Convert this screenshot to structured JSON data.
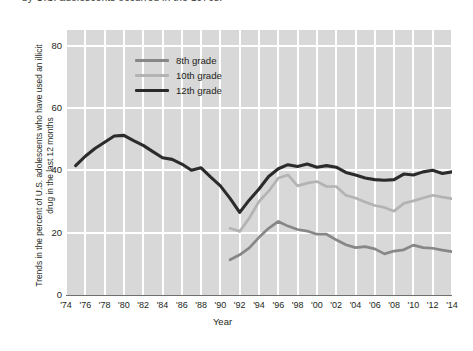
{
  "caption": {
    "text": "by U.S. adolescents occurred in the 1970s."
  },
  "axes": {
    "ylabel": "Trends in the percent of U.S. adolescents who have used an illicit drug in the last 12 months",
    "xlabel": "Year",
    "yticks": [
      "0",
      "20",
      "40",
      "60",
      "80"
    ],
    "xticks": [
      "'74",
      "'76",
      "'78",
      "'80",
      "'82",
      "'84",
      "'86",
      "'88",
      "'90",
      "'92",
      "'94",
      "'96",
      "'98",
      "'00",
      "'02",
      "'04",
      "'06",
      "'08",
      "'10",
      "'12",
      "'14"
    ]
  },
  "legend": {
    "items": [
      {
        "label": "8th grade",
        "color": "#878787"
      },
      {
        "label": "10th grade",
        "color": "#b3b3b3"
      },
      {
        "label": "12th grade",
        "color": "#2b2b2b"
      }
    ]
  },
  "colors": {
    "plot_background": "#d8d8d8",
    "gridline": "#ffffff",
    "axis": "#6f6f6f",
    "text": "#231f20"
  },
  "chart_data": {
    "type": "line",
    "title": "",
    "xlabel": "Year",
    "ylabel": "Trends in the percent of U.S. adolescents who have used an illicit drug in the last 12 months",
    "xlim": [
      1974,
      2014
    ],
    "ylim": [
      0,
      85
    ],
    "grid": true,
    "legend_position": "upper-left-inside",
    "series": [
      {
        "name": "8th grade",
        "color": "#878787",
        "x": [
          1991,
          1992,
          1993,
          1994,
          1995,
          1996,
          1997,
          1998,
          1999,
          2000,
          2001,
          2002,
          2003,
          2004,
          2005,
          2006,
          2007,
          2008,
          2009,
          2010,
          2011,
          2012,
          2013,
          2014
        ],
        "values": [
          11.3,
          12.9,
          15.1,
          18.5,
          21.4,
          23.6,
          22.1,
          21.0,
          20.5,
          19.5,
          19.5,
          17.7,
          16.1,
          15.2,
          15.5,
          14.8,
          13.2,
          14.1,
          14.5,
          16.0,
          15.2,
          15.0,
          14.4,
          13.9
        ]
      },
      {
        "name": "10th grade",
        "color": "#b3b3b3",
        "x": [
          1991,
          1992,
          1993,
          1994,
          1995,
          1996,
          1997,
          1998,
          1999,
          2000,
          2001,
          2002,
          2003,
          2004,
          2005,
          2006,
          2007,
          2008,
          2009,
          2010,
          2011,
          2012,
          2013,
          2014
        ],
        "values": [
          21.4,
          20.4,
          24.7,
          30.0,
          33.3,
          37.5,
          38.5,
          35.0,
          35.9,
          36.4,
          34.8,
          34.8,
          32.0,
          31.1,
          29.8,
          28.7,
          28.1,
          26.9,
          29.4,
          30.2,
          31.1,
          32.0,
          31.4,
          30.9
        ]
      },
      {
        "name": "12th grade",
        "color": "#2b2b2b",
        "x": [
          1975,
          1976,
          1977,
          1978,
          1979,
          1980,
          1981,
          1982,
          1983,
          1984,
          1985,
          1986,
          1987,
          1988,
          1989,
          1990,
          1991,
          1992,
          1993,
          1994,
          1995,
          1996,
          1997,
          1998,
          1999,
          2000,
          2001,
          2002,
          2003,
          2004,
          2005,
          2006,
          2007,
          2008,
          2009,
          2010,
          2011,
          2012,
          2013,
          2014
        ],
        "values": [
          41.5,
          44.5,
          47.0,
          49.0,
          51.0,
          51.2,
          49.5,
          48.0,
          46.0,
          44.0,
          43.5,
          42.0,
          40.0,
          40.8,
          37.8,
          35.0,
          31.0,
          26.5,
          30.5,
          34.0,
          38.0,
          40.5,
          41.8,
          41.2,
          42.0,
          41.0,
          41.5,
          41.0,
          39.3,
          38.5,
          37.5,
          37.0,
          36.8,
          37.0,
          38.8,
          38.5,
          39.5,
          40.0,
          39.0,
          39.5
        ]
      }
    ]
  }
}
